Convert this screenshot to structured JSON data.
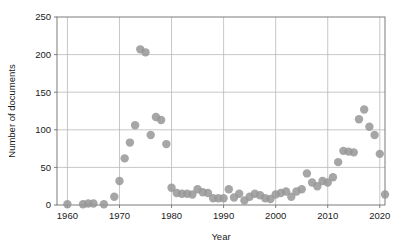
{
  "chart_data": {
    "type": "scatter",
    "title": "",
    "xlabel": "Year",
    "ylabel": "Number of documents",
    "xlim": [
      1958,
      2021
    ],
    "ylim": [
      0,
      250
    ],
    "xticks": [
      1960,
      1970,
      1980,
      1990,
      2000,
      2010,
      2020
    ],
    "yticks": [
      0,
      50,
      100,
      150,
      200,
      250
    ],
    "grid": true,
    "legend": "none",
    "marker": {
      "shape": "circle",
      "color": "#969696",
      "size": 4.2
    },
    "series": [
      {
        "name": "Number of documents",
        "points": [
          [
            1960,
            1
          ],
          [
            1963,
            1
          ],
          [
            1964,
            2
          ],
          [
            1965,
            2
          ],
          [
            1967,
            1
          ],
          [
            1969,
            11
          ],
          [
            1970,
            32
          ],
          [
            1971,
            62
          ],
          [
            1972,
            83
          ],
          [
            1973,
            106
          ],
          [
            1974,
            207
          ],
          [
            1975,
            203
          ],
          [
            1976,
            93
          ],
          [
            1977,
            117
          ],
          [
            1978,
            113
          ],
          [
            1979,
            81
          ],
          [
            1980,
            23
          ],
          [
            1981,
            16
          ],
          [
            1982,
            15
          ],
          [
            1983,
            15
          ],
          [
            1984,
            14
          ],
          [
            1985,
            21
          ],
          [
            1986,
            17
          ],
          [
            1987,
            16
          ],
          [
            1988,
            9
          ],
          [
            1989,
            9
          ],
          [
            1990,
            9
          ],
          [
            1991,
            21
          ],
          [
            1992,
            10
          ],
          [
            1993,
            15
          ],
          [
            1994,
            6
          ],
          [
            1995,
            11
          ],
          [
            1996,
            15
          ],
          [
            1997,
            13
          ],
          [
            1998,
            9
          ],
          [
            1999,
            8
          ],
          [
            2000,
            14
          ],
          [
            2001,
            16
          ],
          [
            2002,
            18
          ],
          [
            2003,
            11
          ],
          [
            2004,
            18
          ],
          [
            2005,
            21
          ],
          [
            2006,
            42
          ],
          [
            2007,
            30
          ],
          [
            2008,
            25
          ],
          [
            2009,
            32
          ],
          [
            2010,
            30
          ],
          [
            2011,
            37
          ],
          [
            2012,
            57
          ],
          [
            2013,
            72
          ],
          [
            2014,
            71
          ],
          [
            2015,
            70
          ],
          [
            2016,
            114
          ],
          [
            2017,
            127
          ],
          [
            2018,
            104
          ],
          [
            2019,
            93
          ],
          [
            2020,
            68
          ],
          [
            2021,
            14
          ]
        ]
      }
    ]
  },
  "axes": {
    "y_tick_labels": [
      "0",
      "50",
      "100",
      "150",
      "200",
      "250"
    ],
    "x_tick_labels": [
      "1960",
      "1970",
      "1980",
      "1990",
      "2000",
      "2010",
      "2020"
    ],
    "y_axis_title": "Number of documents",
    "x_axis_title": "Year"
  }
}
